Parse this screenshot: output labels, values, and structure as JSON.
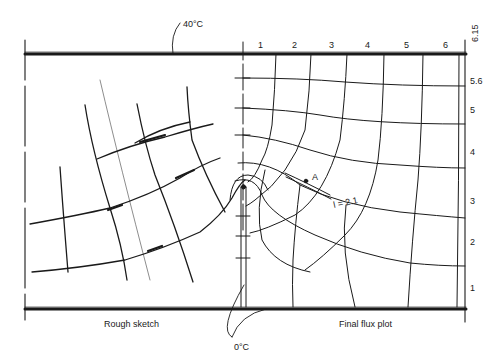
{
  "figure": {
    "type": "flux plot diagram",
    "panels": [
      {
        "name": "left",
        "caption": "Rough sketch"
      },
      {
        "name": "right",
        "caption": "Final flux plot"
      }
    ],
    "boundary_labels": {
      "top": "40°C",
      "bottom": "0°C"
    },
    "top_axis_ticks": [
      "1",
      "2",
      "3",
      "4",
      "5",
      "6"
    ],
    "top_axis_end_label": "6.15",
    "right_axis_ticks": [
      "5.6",
      "5",
      "4",
      "3",
      "2",
      "1"
    ],
    "annotations": {
      "point": "A",
      "length_label": "l = 2.1"
    },
    "colors": {
      "ink": "#1a1a1a",
      "background": "#ffffff"
    }
  }
}
